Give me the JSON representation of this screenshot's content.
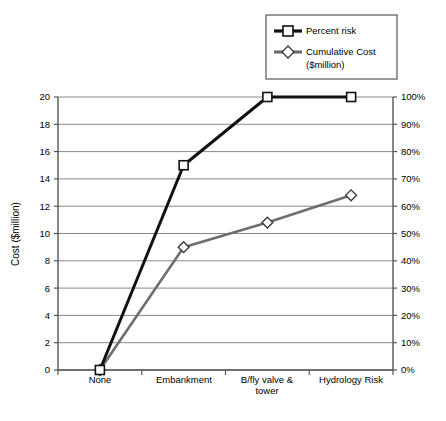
{
  "chart_data": {
    "type": "line",
    "title": "",
    "categories": [
      "None",
      "Embankment",
      "B/fly valve & tower",
      "Hydrology Risk"
    ],
    "category_lines": [
      [
        "None"
      ],
      [
        "Embankment"
      ],
      [
        "B/fly valve &",
        "tower"
      ],
      [
        "Hydrology Risk"
      ]
    ],
    "series": [
      {
        "name": "Percent risk",
        "axis": "right",
        "unit": "%",
        "values_percent": [
          0,
          75,
          100,
          100
        ],
        "values_on_left_scale": [
          0,
          15,
          20,
          20
        ],
        "color": "#111111",
        "marker": "square",
        "marker_fill": "#ffffff",
        "line_width": 3
      },
      {
        "name": "Cumulative Cost ($million)",
        "axis": "left",
        "unit": "$million",
        "values": [
          0.0,
          9.0,
          10.8,
          12.8
        ],
        "color": "#6e6e6e",
        "marker": "diamond",
        "marker_fill": "#ffffff",
        "line_width": 2.6
      }
    ],
    "xlabel": "",
    "ylabel": "Cost ($million)",
    "ylim": [
      0,
      20
    ],
    "y_ticks": [
      "0",
      "2",
      "4",
      "6",
      "8",
      "10",
      "12",
      "14",
      "16",
      "18",
      "20"
    ],
    "y2label": "",
    "y2lim": [
      0,
      100
    ],
    "y2_ticks": [
      "0%",
      "10%",
      "20%",
      "30%",
      "40%",
      "50%",
      "60%",
      "70%",
      "80%",
      "90%",
      "100%"
    ],
    "grid": "horizontal",
    "legend_position": "top-right",
    "legend": [
      {
        "label": "Percent risk",
        "marker": "square",
        "color": "#111111"
      },
      {
        "label": "Cumulative Cost",
        "label2": "($million)",
        "marker": "diamond",
        "color": "#6e6e6e"
      }
    ]
  },
  "axes": {
    "left_title": "Cost ($million)",
    "y_ticks": [
      "20",
      "18",
      "16",
      "14",
      "12",
      "10",
      "8",
      "6",
      "4",
      "2",
      "0"
    ],
    "y2_ticks": [
      "100%",
      "90%",
      "80%",
      "70%",
      "60%",
      "50%",
      "40%",
      "30%",
      "20%",
      "10%",
      "0%"
    ],
    "x_labels": [
      "None",
      "Embankment",
      "B/fly valve &",
      "tower",
      "Hydrology Risk"
    ]
  },
  "legend": {
    "item1_label": "Percent risk",
    "item2_label_line1": "Cumulative Cost",
    "item2_label_line2": "($million)"
  },
  "colors": {
    "percent_risk": "#111111",
    "cumulative_cost": "#6e6e6e",
    "grid": "#7a7a7a",
    "axis": "#4d4d4d",
    "background": "#ffffff"
  }
}
